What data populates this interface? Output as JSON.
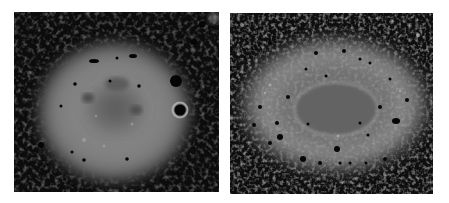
{
  "figure": {
    "background": "#ffffff",
    "panels": [
      {
        "id": "left",
        "description": "Grayscale image of a roughly round nebula with diffuse halo and darker mottled core",
        "halo_color": "#8a8a8a",
        "core_color": "#6c6c6c",
        "sky_color": "#0c0c0c"
      },
      {
        "id": "right",
        "description": "Grayscale image of an elliptical nebula with bright outer shell and inner elliptical ring",
        "halo_color": "#808080",
        "core_color": "#6a6a6a",
        "sky_color": "#0e0e0e"
      }
    ]
  }
}
